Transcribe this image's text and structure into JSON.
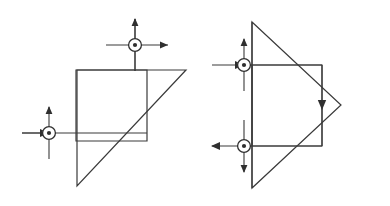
{
  "figure": {
    "background_color": "#ffffff",
    "line_color": "#3a3a3a",
    "marker_color": "#2f2f2f",
    "width": 390,
    "height": 206,
    "panels": [
      {
        "id": "left-panel",
        "name": "right-triangle-with-inscribed-square",
        "shapes": [
          {
            "name": "triangle-outline",
            "type": "polygon",
            "points": "77,70 186,70 77,186",
            "description": "right triangle, vertical left leg, horizontal top leg, hypotenuse from top-right down to bottom-left"
          },
          {
            "name": "inscribed-square",
            "type": "polygon",
            "points": "76,70 147,70 147,141 76,141",
            "description": "square sharing the triangle top-left corner, bottom-right corner touching hypotenuse"
          }
        ],
        "markers": [
          {
            "name": "marker-top",
            "cx": 135,
            "cy": 45,
            "symbol": "dot-in-circle",
            "horizontal_arrow": "right-outward",
            "vertical_arrow": "up-outward",
            "h_start": 106,
            "h_end": 166,
            "v_start": 71,
            "v_end": 19
          },
          {
            "name": "marker-left",
            "cx": 49,
            "cy": 133,
            "symbol": "dot-in-circle",
            "horizontal_arrow": "right-inward",
            "vertical_arrow": "up-outward",
            "h_start": 22,
            "h_end": 80,
            "v_start": 158,
            "v_end": 108
          }
        ],
        "guide_lines": [
          {
            "name": "vertical-guide-top-marker",
            "x1": 135,
            "y1": 19,
            "x2": 135,
            "y2": 71
          },
          {
            "name": "horizontal-guide-left-marker",
            "x1": 22,
            "y1": 133,
            "x2": 147,
            "y2": 133
          }
        ]
      },
      {
        "id": "right-panel",
        "name": "right-pointing-triangle-with-inscribed-rectangle",
        "shapes": [
          {
            "name": "triangle-outline",
            "type": "polygon",
            "points": "252,22 341,105 252,188",
            "description": "isoceles triangle pointing right, vertical left edge implied"
          },
          {
            "name": "triangle-left-edge",
            "type": "line",
            "points": "252,22 252,188",
            "description": "vertical left edge of the right-pointing triangle"
          },
          {
            "name": "inscribed-rectangle",
            "type": "polygon",
            "points": "252,65 322,65 322,146 252,146",
            "description": "rectangle inside triangle, right edge carries downward flow arrow"
          }
        ],
        "markers": [
          {
            "name": "marker-upper",
            "cx": 244,
            "cy": 65,
            "symbol": "dot-in-circle",
            "horizontal_arrow": "right-inward",
            "vertical_arrow": "up-outward",
            "h_start": 212,
            "h_end": 322,
            "v_start": 91,
            "v_end": 39
          },
          {
            "name": "marker-lower",
            "cx": 244,
            "cy": 146,
            "symbol": "dot-in-circle",
            "horizontal_arrow": "left-outward",
            "vertical_arrow": "down-outward",
            "h_start": 322,
            "h_end": 212,
            "v_start": 120,
            "v_end": 172
          }
        ],
        "flow_arrows": [
          {
            "name": "downward-flow-arrow",
            "x": 322,
            "y_start": 65,
            "y_end": 146,
            "head_at": 105,
            "direction": "down"
          }
        ]
      }
    ]
  }
}
